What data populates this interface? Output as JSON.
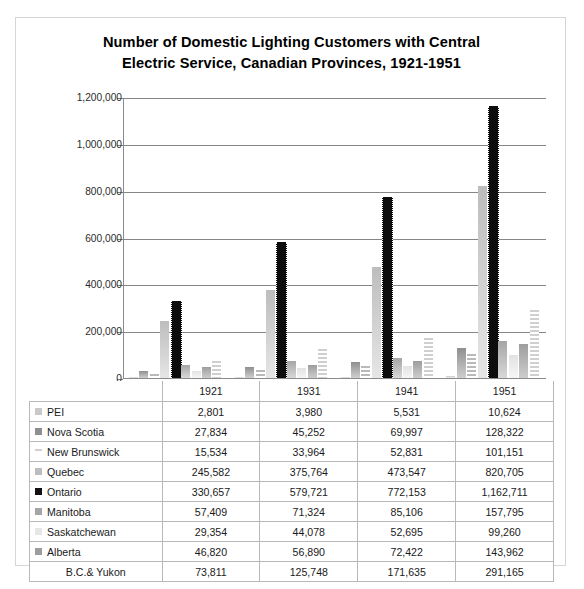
{
  "chart_data": {
    "type": "bar",
    "title": "Number of Domestic Lighting Customers with Central Electric Service, Canadian Provinces, 1921-1951",
    "title_line_1": "Number of Domestic Lighting Customers with Central",
    "title_line_2": "Electric Service, Canadian Provinces, 1921-1951",
    "xlabel": "",
    "ylabel": "",
    "ylim": [
      0,
      1200000
    ],
    "grid": true,
    "legend_position": "data-table-row-headers",
    "categories": [
      "1921",
      "1931",
      "1941",
      "1951"
    ],
    "ytick_labels": [
      "1,200,000",
      "1,000,000",
      "800,000",
      "600,000",
      "400,000",
      "200,000",
      "0"
    ],
    "ytick_values": [
      1200000,
      1000000,
      800000,
      600000,
      400000,
      200000,
      0
    ],
    "series": [
      {
        "name": "PEI",
        "key": "pei",
        "swatch": "#c9c9c9",
        "values": [
          2801,
          3980,
          5531,
          10624
        ],
        "labels": [
          "2,801",
          "3,980",
          "5,531",
          "10,624"
        ]
      },
      {
        "name": "Nova Scotia",
        "key": "ns",
        "swatch": "#8f8f8f",
        "values": [
          27834,
          45252,
          69997,
          128322
        ],
        "labels": [
          "27,834",
          "45,252",
          "69,997",
          "128,322"
        ]
      },
      {
        "name": "New Brunswick",
        "key": "nb",
        "swatch": "#cfcfcf",
        "values": [
          15534,
          33964,
          52831,
          101151
        ],
        "labels": [
          "15,534",
          "33,964",
          "52,831",
          "101,151"
        ]
      },
      {
        "name": "Quebec",
        "key": "qc",
        "swatch": "#bdbdbd",
        "values": [
          245582,
          375764,
          473547,
          820705
        ],
        "labels": [
          "245,582",
          "375,764",
          "473,547",
          "820,705"
        ]
      },
      {
        "name": "Ontario",
        "key": "on",
        "swatch": "#111111",
        "values": [
          330657,
          579721,
          772153,
          1162711
        ],
        "labels": [
          "330,657",
          "579,721",
          "772,153",
          "1,162,711"
        ]
      },
      {
        "name": "Manitoba",
        "key": "mb",
        "swatch": "#a5a5a5",
        "values": [
          57409,
          71324,
          85106,
          157795
        ],
        "labels": [
          "57,409",
          "71,324",
          "85,106",
          "157,795"
        ]
      },
      {
        "name": "Saskatchewan",
        "key": "sk",
        "swatch": "#e6e6e6",
        "values": [
          29354,
          44078,
          52695,
          99260
        ],
        "labels": [
          "29,354",
          "44,078",
          "52,695",
          "99,260"
        ]
      },
      {
        "name": "Alberta",
        "key": "ab",
        "swatch": "#9d9d9d",
        "values": [
          46820,
          56890,
          72422,
          143962
        ],
        "labels": [
          "46,820",
          "56,890",
          "72,422",
          "143,962"
        ]
      },
      {
        "name": "B.C.& Yukon",
        "key": "bc",
        "swatch": "transparent",
        "values": [
          73811,
          125748,
          171635,
          291165
        ],
        "labels": [
          "73,811",
          "125,748",
          "171,635",
          "291,165"
        ]
      }
    ]
  },
  "table": {
    "corner_label": "",
    "column_headers": [
      "1921",
      "1931",
      "1941",
      "1951"
    ]
  }
}
